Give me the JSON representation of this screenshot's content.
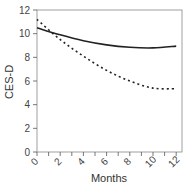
{
  "chart_data": {
    "type": "line",
    "title": "",
    "xlabel": "Months",
    "ylabel": "CES-D",
    "xlim": [
      0,
      12.5
    ],
    "ylim": [
      0,
      12
    ],
    "x_ticks": [
      0,
      2,
      4,
      6,
      8,
      10,
      12
    ],
    "y_ticks": [
      0,
      2,
      4,
      6,
      8,
      10,
      12
    ],
    "grid": false,
    "legend": null,
    "series": [
      {
        "name": "solid",
        "style": "solid",
        "x": [
          0,
          2,
          4,
          6,
          8,
          10,
          12
        ],
        "values": [
          10.5,
          9.9,
          9.4,
          9.05,
          8.85,
          8.8,
          8.95
        ]
      },
      {
        "name": "dashed",
        "style": "dotted",
        "x": [
          0,
          2,
          4,
          6,
          8,
          10,
          12
        ],
        "values": [
          11.2,
          9.5,
          8.1,
          6.9,
          6.0,
          5.4,
          5.35
        ]
      }
    ]
  },
  "labels": {
    "xlabel": "Months",
    "ylabel": "CES-D",
    "x_ticks": [
      "0",
      "2",
      "4",
      "6",
      "8",
      "10",
      "12"
    ],
    "y_ticks": [
      "0",
      "2",
      "4",
      "6",
      "8",
      "10",
      "12"
    ]
  },
  "colors": {
    "line": "#222222",
    "axis": "#555555"
  }
}
